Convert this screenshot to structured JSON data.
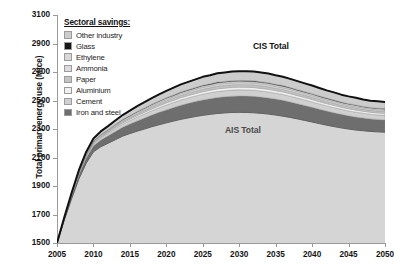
{
  "chart_data": {
    "type": "area",
    "title": "",
    "xlabel": "",
    "ylabel": "Total primary energy use (Mtce)",
    "xlim": [
      2005,
      2050
    ],
    "ylim": [
      1500,
      3100
    ],
    "xticks": [
      "2005",
      "2010",
      "2015",
      "2020",
      "2025",
      "2030",
      "2035",
      "2040",
      "2045",
      "2050"
    ],
    "yticks": [
      "1500",
      "1700",
      "1900",
      "2100",
      "2300",
      "2500",
      "2700",
      "2900",
      "3100"
    ],
    "grid": false,
    "legend_title": "Sectoral savings:",
    "legend_position": "inside-top-left",
    "stacking": "baseline-is-AIS-Total, bands stack up to CIS Total",
    "annotations": [
      {
        "text": "CIS Total",
        "x": 2027,
        "y": 2900
      },
      {
        "text": "AIS Total",
        "x": 2022,
        "y": 2390
      }
    ],
    "x": [
      2005,
      2006,
      2007,
      2008,
      2009,
      2010,
      2011,
      2012,
      2013,
      2014,
      2015,
      2016,
      2017,
      2018,
      2019,
      2020,
      2021,
      2022,
      2023,
      2024,
      2025,
      2026,
      2027,
      2028,
      2029,
      2030,
      2031,
      2032,
      2033,
      2034,
      2035,
      2036,
      2037,
      2038,
      2039,
      2040,
      2041,
      2042,
      2043,
      2044,
      2045,
      2046,
      2047,
      2048,
      2049,
      2050
    ],
    "series": [
      {
        "name": "AIS Total",
        "role": "baseline",
        "color": "#d5d5d5",
        "values": [
          1500,
          1660,
          1810,
          1950,
          2060,
          2140,
          2175,
          2200,
          2225,
          2250,
          2268,
          2285,
          2300,
          2316,
          2330,
          2343,
          2356,
          2368,
          2378,
          2388,
          2396,
          2403,
          2409,
          2413,
          2416,
          2417,
          2416,
          2414,
          2410,
          2405,
          2398,
          2390,
          2381,
          2371,
          2360,
          2349,
          2338,
          2327,
          2317,
          2308,
          2300,
          2293,
          2288,
          2283,
          2280,
          2278
        ]
      },
      {
        "name": "Iron and steel",
        "color": "#6e6e6e",
        "values": [
          0,
          10,
          19,
          28,
          36,
          42,
          47,
          52,
          57,
          62,
          67,
          72,
          77,
          82,
          87,
          91,
          95,
          99,
          102,
          105,
          108,
          110,
          112,
          113,
          114,
          115,
          115,
          115,
          114,
          113,
          112,
          111,
          109,
          107,
          105,
          103,
          101,
          99,
          97,
          95,
          93,
          91,
          90,
          88,
          87,
          86
        ]
      },
      {
        "name": "Cement",
        "color": "#d0d0d0",
        "values": [
          0,
          3,
          6,
          9,
          12,
          14,
          16,
          18,
          20,
          22,
          24,
          26,
          28,
          30,
          32,
          34,
          35,
          37,
          38,
          39,
          40,
          41,
          42,
          42,
          43,
          43,
          43,
          43,
          42,
          42,
          41,
          41,
          40,
          39,
          39,
          38,
          37,
          36,
          36,
          35,
          34,
          34,
          33,
          33,
          32,
          32
        ]
      },
      {
        "name": "Aluminium",
        "color": "#efefef",
        "values": [
          0,
          1,
          2,
          3,
          4,
          5,
          6,
          7,
          8,
          9,
          10,
          11,
          12,
          13,
          14,
          15,
          15,
          16,
          17,
          17,
          18,
          18,
          19,
          19,
          19,
          19,
          19,
          19,
          19,
          19,
          18,
          18,
          18,
          17,
          17,
          17,
          16,
          16,
          16,
          15,
          15,
          15,
          14,
          14,
          14,
          14
        ]
      },
      {
        "name": "Paper",
        "color": "#c4c4c4",
        "values": [
          0,
          1,
          2,
          3,
          4,
          5,
          6,
          7,
          8,
          9,
          10,
          11,
          12,
          13,
          13,
          14,
          15,
          15,
          16,
          16,
          17,
          17,
          18,
          18,
          18,
          18,
          18,
          18,
          18,
          17,
          17,
          17,
          17,
          16,
          16,
          16,
          15,
          15,
          15,
          14,
          14,
          14,
          13,
          13,
          13,
          13
        ]
      },
      {
        "name": "Ammonia",
        "color": "#dcdcdc",
        "values": [
          0,
          1,
          2,
          3,
          3,
          4,
          5,
          5,
          6,
          7,
          7,
          8,
          8,
          9,
          9,
          10,
          10,
          11,
          11,
          12,
          12,
          12,
          13,
          13,
          13,
          13,
          13,
          13,
          13,
          13,
          12,
          12,
          12,
          12,
          11,
          11,
          11,
          11,
          10,
          10,
          10,
          10,
          9,
          9,
          9,
          9
        ]
      },
      {
        "name": "Ethylene",
        "color": "#d8d8d8",
        "values": [
          0,
          1,
          1,
          2,
          3,
          3,
          4,
          4,
          5,
          5,
          6,
          6,
          7,
          7,
          8,
          8,
          8,
          9,
          9,
          9,
          10,
          10,
          10,
          10,
          10,
          10,
          10,
          10,
          10,
          10,
          10,
          10,
          9,
          9,
          9,
          9,
          9,
          8,
          8,
          8,
          8,
          8,
          7,
          7,
          7,
          7
        ]
      },
      {
        "name": "Glass",
        "color": "#171717",
        "values": [
          0,
          0,
          1,
          1,
          1,
          2,
          2,
          2,
          3,
          3,
          3,
          4,
          4,
          4,
          4,
          5,
          5,
          5,
          5,
          5,
          6,
          6,
          6,
          6,
          6,
          6,
          6,
          6,
          6,
          6,
          6,
          6,
          5,
          5,
          5,
          5,
          5,
          5,
          5,
          4,
          4,
          4,
          4,
          4,
          4,
          4
        ]
      },
      {
        "name": "Other industry",
        "color": "#cccccc",
        "values": [
          0,
          4,
          8,
          12,
          16,
          19,
          22,
          25,
          28,
          31,
          34,
          37,
          40,
          43,
          46,
          48,
          51,
          53,
          55,
          57,
          59,
          60,
          62,
          63,
          64,
          64,
          65,
          65,
          64,
          64,
          63,
          62,
          61,
          60,
          58,
          57,
          56,
          54,
          53,
          52,
          51,
          50,
          49,
          48,
          48,
          47
        ]
      }
    ],
    "legend_items": [
      {
        "label": "Other industry",
        "color": "#cccccc"
      },
      {
        "label": "Glass",
        "color": "#171717"
      },
      {
        "label": "Ethylene",
        "color": "#d8d8d8"
      },
      {
        "label": "Ammonia",
        "color": "#dcdcdc"
      },
      {
        "label": "Paper",
        "color": "#c4c4c4"
      },
      {
        "label": "Aluminium",
        "color": "#efefef"
      },
      {
        "label": "Cement",
        "color": "#d0d0d0"
      },
      {
        "label": "Iron and steel",
        "color": "#6e6e6e"
      }
    ],
    "outline_color": "#111111",
    "axis_color": "#9a9a9a"
  },
  "caption": ""
}
